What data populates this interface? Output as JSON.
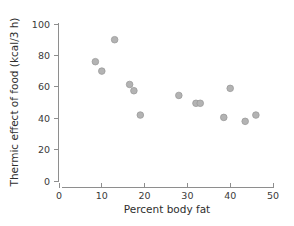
{
  "chart_data": {
    "type": "scatter",
    "title": "",
    "xlabel": "Percent body fat",
    "ylabel": "Thermic effect of food (kcal/3 h)",
    "xlim": [
      0,
      50
    ],
    "ylim": [
      0,
      100
    ],
    "xticks": [
      0,
      10,
      20,
      30,
      40,
      50
    ],
    "yticks": [
      0,
      20,
      40,
      60,
      80,
      100
    ],
    "xtick_labels": [
      "0",
      "10",
      "20",
      "30",
      "40",
      "50"
    ],
    "ytick_labels": [
      "0",
      "20",
      "40",
      "60",
      "80",
      "100"
    ],
    "grid": false,
    "legend": null,
    "marker": {
      "shape": "circle",
      "fill_color": "#b3b3b3",
      "edge_color": "#9a9a9a",
      "size": 3.3
    },
    "series": [
      {
        "name": "Thermic effect of food vs percent body fat",
        "points": [
          {
            "x": 8.5,
            "y": 76.0
          },
          {
            "x": 10.0,
            "y": 70.0
          },
          {
            "x": 13.0,
            "y": 90.0
          },
          {
            "x": 16.5,
            "y": 61.5
          },
          {
            "x": 17.5,
            "y": 57.5
          },
          {
            "x": 19.0,
            "y": 42.0
          },
          {
            "x": 28.0,
            "y": 54.5
          },
          {
            "x": 32.0,
            "y": 49.5
          },
          {
            "x": 33.0,
            "y": 49.5
          },
          {
            "x": 38.5,
            "y": 40.5
          },
          {
            "x": 40.0,
            "y": 59.0
          },
          {
            "x": 43.5,
            "y": 38.0
          },
          {
            "x": 46.0,
            "y": 42.0
          }
        ]
      }
    ]
  },
  "axes": {
    "x_axis_name": "percent-body-fat-axis",
    "y_axis_name": "thermic-effect-axis"
  },
  "colors": {
    "axis": "#8e8e8e",
    "text": "#2e2e2e",
    "marker_fill": "#b3b3b3",
    "marker_edge": "#9a9a9a",
    "background": "#ffffff"
  }
}
